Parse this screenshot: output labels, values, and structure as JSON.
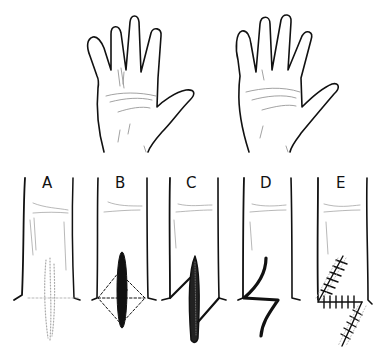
{
  "figure": {
    "type": "medical-illustration",
    "top_row": {
      "panels": [
        {
          "name": "hand-before",
          "description": "Left palm with longitudinal scar band at base of ring finger"
        },
        {
          "name": "hand-after",
          "description": "Palm after repair, fingers extended"
        }
      ]
    },
    "bottom_row": {
      "panels": [
        {
          "label": "A",
          "description": "Finger segment with longitudinal contracture scar crossing the crease"
        },
        {
          "label": "B",
          "description": "Scar excised (black ellipse) with dashed rhomboid outlining planned Z limbs"
        },
        {
          "label": "C",
          "description": "Z-shaped incision drawn with oblique limbs from ends of excision"
        },
        {
          "label": "D",
          "description": "Flaps transposed forming reversed Z configuration"
        },
        {
          "label": "E",
          "description": "Closed Z-plasty with sutures along transposed limbs"
        }
      ]
    },
    "colors": {
      "ink": "#111111",
      "shading": "#9a9a9a",
      "background": "#ffffff"
    }
  }
}
